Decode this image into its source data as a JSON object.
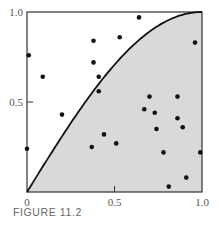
{
  "figure": {
    "caption": "FIGURE 11.2"
  },
  "colors": {
    "frame": "#333333",
    "curve": "#111111",
    "fill": "#d9d9d9",
    "point": "#111111",
    "text": "#555555"
  },
  "chart_data": {
    "type": "scatter",
    "title": "",
    "caption": "FIGURE 11.2",
    "xlabel": "",
    "ylabel": "",
    "xlim": [
      0,
      1
    ],
    "ylim": [
      0,
      1
    ],
    "x_ticks": [
      0,
      0.5,
      1.0
    ],
    "x_tick_labels": [
      "0",
      "0.5",
      "1.0"
    ],
    "y_ticks": [
      0.5,
      1.0
    ],
    "y_tick_labels": [
      "0.5",
      "1.0"
    ],
    "grid": false,
    "legend": null,
    "curve": {
      "description": "y = sin(pi*x/2), region under curve shaded gray",
      "function": "sin(pi*x/2)",
      "shaded_below": true
    },
    "series": [
      {
        "name": "random points",
        "points": [
          [
            0.64,
            0.97
          ],
          [
            0.38,
            0.84
          ],
          [
            0.96,
            0.83
          ],
          [
            0.53,
            0.86
          ],
          [
            0.01,
            0.76
          ],
          [
            0.09,
            0.64
          ],
          [
            0.38,
            0.72
          ],
          [
            0.41,
            0.64
          ],
          [
            0.41,
            0.56
          ],
          [
            0.2,
            0.43
          ],
          [
            0.0,
            0.24
          ],
          [
            0.7,
            0.53
          ],
          [
            0.86,
            0.53
          ],
          [
            0.67,
            0.46
          ],
          [
            0.73,
            0.44
          ],
          [
            0.74,
            0.35
          ],
          [
            0.86,
            0.41
          ],
          [
            0.89,
            0.36
          ],
          [
            0.44,
            0.32
          ],
          [
            0.51,
            0.27
          ],
          [
            0.37,
            0.25
          ],
          [
            0.78,
            0.22
          ],
          [
            0.99,
            0.22
          ],
          [
            0.91,
            0.08
          ],
          [
            0.81,
            0.03
          ]
        ]
      }
    ]
  }
}
